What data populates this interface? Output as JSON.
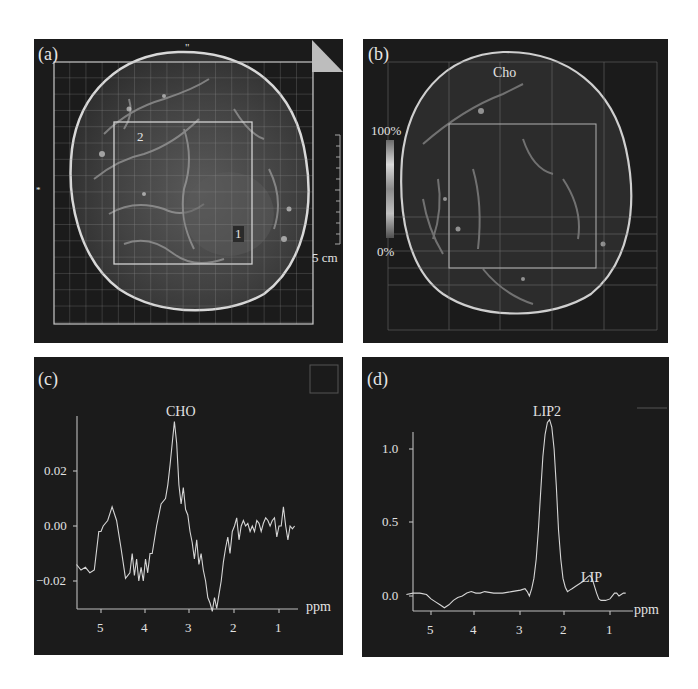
{
  "figure": {
    "panels": [
      {
        "id": "a",
        "label": "(a)",
        "type": "mri-image",
        "annotations": {
          "marker_1": "1",
          "marker_2": "2",
          "scale_bar": "5 cm",
          "top_mark": "\"",
          "left_mark": "*"
        }
      },
      {
        "id": "b",
        "label": "(b)",
        "type": "metabolite-map",
        "map_title": "Cho",
        "colorbar": {
          "max_label": "100%",
          "min_label": "0%"
        }
      },
      {
        "id": "c",
        "label": "(c)",
        "type": "spectrum",
        "peak_label": "CHO",
        "x_unit": "ppm",
        "y_ticks": [
          "0.02",
          "0.00",
          "−0.02"
        ],
        "x_ticks": [
          "5",
          "4",
          "3",
          "2",
          "1"
        ]
      },
      {
        "id": "d",
        "label": "(d)",
        "type": "spectrum",
        "peak_labels": [
          "LIP2",
          "LIP"
        ],
        "x_unit": "ppm",
        "y_ticks": [
          "1.0",
          "0.5",
          "0.0"
        ],
        "x_ticks": [
          "5",
          "4",
          "3",
          "2",
          "1"
        ]
      }
    ]
  },
  "chart_data": [
    {
      "type": "line",
      "title": "(c) CHO spectrum",
      "xlabel": "ppm",
      "ylabel": "",
      "xlim": [
        5.55,
        0.6
      ],
      "ylim": [
        -0.03,
        0.04
      ],
      "x_ticks": [
        5,
        4,
        3,
        2,
        1
      ],
      "y_ticks": [
        0.02,
        0.0,
        -0.02
      ],
      "grid": false,
      "annotations": [
        {
          "text": "CHO",
          "x": 3.25,
          "y": 0.038
        }
      ],
      "series": [
        {
          "name": "spectrum",
          "x": [
            5.55,
            5.45,
            5.35,
            5.25,
            5.15,
            5.05,
            5.0,
            4.95,
            4.85,
            4.75,
            4.65,
            4.55,
            4.45,
            4.35,
            4.3,
            4.25,
            4.2,
            4.15,
            4.1,
            4.05,
            4.0,
            3.95,
            3.9,
            3.85,
            3.75,
            3.65,
            3.55,
            3.5,
            3.45,
            3.4,
            3.35,
            3.3,
            3.25,
            3.2,
            3.15,
            3.1,
            3.05,
            3.0,
            2.95,
            2.9,
            2.85,
            2.8,
            2.75,
            2.7,
            2.65,
            2.6,
            2.55,
            2.5,
            2.45,
            2.4,
            2.35,
            2.3,
            2.25,
            2.2,
            2.15,
            2.1,
            2.05,
            2.0,
            1.95,
            1.9,
            1.85,
            1.8,
            1.75,
            1.7,
            1.65,
            1.6,
            1.55,
            1.5,
            1.45,
            1.4,
            1.35,
            1.3,
            1.25,
            1.2,
            1.15,
            1.1,
            1.05,
            1.0,
            0.95,
            0.9,
            0.85,
            0.8,
            0.75,
            0.7,
            0.65
          ],
          "y": [
            -0.014,
            -0.016,
            -0.015,
            -0.017,
            -0.016,
            -0.002,
            -0.002,
            0.0,
            0.002,
            0.007,
            0.002,
            -0.008,
            -0.019,
            -0.017,
            -0.01,
            -0.018,
            -0.012,
            -0.02,
            -0.015,
            -0.02,
            -0.012,
            -0.017,
            -0.01,
            -0.01,
            0.0,
            0.008,
            0.01,
            0.015,
            0.022,
            0.03,
            0.038,
            0.03,
            0.015,
            0.008,
            0.014,
            0.006,
            0.004,
            -0.002,
            -0.006,
            -0.012,
            -0.005,
            -0.014,
            -0.01,
            -0.016,
            -0.02,
            -0.026,
            -0.028,
            -0.031,
            -0.026,
            -0.03,
            -0.025,
            -0.02,
            -0.013,
            -0.008,
            -0.004,
            -0.01,
            -0.002,
            0.0,
            0.003,
            -0.005,
            0.0,
            0.002,
            0.0,
            0.001,
            -0.002,
            0.0,
            -0.002,
            0.002,
            0.001,
            -0.002,
            0.001,
            0.003,
            0.002,
            0.0,
            0.002,
            0.003,
            -0.004,
            0.0,
            0.0,
            0.007,
            0.0,
            -0.005,
            0.0,
            -0.001,
            0.0
          ]
        }
      ]
    },
    {
      "type": "line",
      "title": "(d) LIP spectrum",
      "xlabel": "ppm",
      "ylabel": "",
      "xlim": [
        5.55,
        0.6
      ],
      "ylim": [
        -0.1,
        1.3
      ],
      "x_ticks": [
        5,
        4,
        3,
        2,
        1
      ],
      "y_ticks": [
        1.0,
        0.5,
        0.0
      ],
      "grid": false,
      "annotations": [
        {
          "text": "LIP2",
          "x": 2.25,
          "y": 1.2
        },
        {
          "text": "LIP",
          "x": 1.4,
          "y": 0.14
        }
      ],
      "series": [
        {
          "name": "spectrum",
          "x": [
            5.55,
            5.4,
            5.25,
            5.1,
            5.0,
            4.9,
            4.8,
            4.7,
            4.6,
            4.5,
            4.4,
            4.3,
            4.2,
            4.1,
            4.0,
            3.9,
            3.8,
            3.6,
            3.4,
            3.2,
            3.0,
            2.9,
            2.85,
            2.8,
            2.75,
            2.7,
            2.65,
            2.6,
            2.55,
            2.5,
            2.45,
            2.4,
            2.35,
            2.3,
            2.25,
            2.2,
            2.15,
            2.1,
            2.05,
            2.0,
            1.95,
            1.9,
            1.85,
            1.8,
            1.75,
            1.7,
            1.6,
            1.5,
            1.45,
            1.4,
            1.35,
            1.3,
            1.25,
            1.2,
            1.1,
            1.0,
            0.9,
            0.85,
            0.8,
            0.7,
            0.65
          ],
          "y": [
            0.01,
            0.02,
            0.02,
            0.01,
            -0.02,
            -0.04,
            -0.06,
            -0.08,
            -0.06,
            -0.03,
            -0.01,
            0.0,
            0.02,
            0.03,
            0.02,
            0.02,
            0.03,
            0.02,
            0.02,
            0.03,
            0.04,
            0.05,
            0.03,
            0.0,
            0.05,
            0.12,
            0.25,
            0.45,
            0.7,
            0.95,
            1.1,
            1.18,
            1.2,
            1.15,
            1.0,
            0.75,
            0.45,
            0.25,
            0.12,
            0.06,
            0.03,
            0.04,
            0.05,
            0.06,
            0.07,
            0.08,
            0.1,
            0.13,
            0.14,
            0.12,
            0.07,
            0.02,
            -0.02,
            -0.03,
            -0.03,
            -0.02,
            0.02,
            0.02,
            0.0,
            0.02,
            0.02
          ]
        }
      ]
    }
  ]
}
